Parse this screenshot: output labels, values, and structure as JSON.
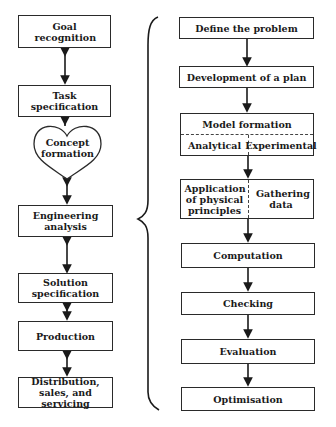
{
  "left_flow": {
    "goal": "Goal recognition",
    "task": "Task specification",
    "concept": "Concept formation",
    "engineering": "Engineering analysis",
    "solution": "Solution specification",
    "production": "Production",
    "distribution": "Distribution, sales, and servicing"
  },
  "right_flow": {
    "define": "Define the problem",
    "plan": "Development of a plan",
    "model": {
      "title": "Model formation",
      "left": "Analytical",
      "right": "Experimental"
    },
    "methods": {
      "left": "Application of physical principles",
      "right": "Gathering data"
    },
    "computation": "Computation",
    "checking": "Checking",
    "evaluation": "Evaluation",
    "optimisation": "Optimisation"
  },
  "connectors": {
    "left": "double-headed-arrows",
    "right": "single-headed-arrows-down",
    "brace": "curly-brace-expanding-engineering-analysis"
  }
}
